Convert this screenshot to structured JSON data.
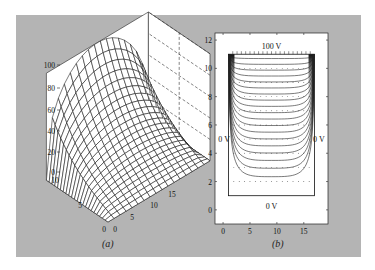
{
  "figure": {
    "background": "#b4b4b4",
    "caption_a": "(a)",
    "caption_b": "(b)"
  },
  "chart_data": [
    {
      "id": "a",
      "type": "surface",
      "title": "",
      "description": "3D mesh surface of potential; 100 at one edge, decaying toward 0",
      "xlabel": "",
      "ylabel": "",
      "zlabel": "",
      "x_ticks": [
        "0",
        "5",
        "10",
        "15"
      ],
      "y_ticks": [
        "0",
        "5",
        "10"
      ],
      "z_ticks": [
        "0",
        "20",
        "40",
        "60",
        "80",
        "100"
      ],
      "xlim": [
        0,
        17
      ],
      "ylim": [
        0,
        11
      ],
      "zlim": [
        0,
        100
      ],
      "grid": false,
      "z_tick_px": [
        172,
        152,
        131,
        110,
        88,
        65
      ]
    },
    {
      "id": "b",
      "type": "contour",
      "title": "",
      "xlabel": "",
      "ylabel": "",
      "x_ticks": [
        "0",
        "5",
        "10",
        "15"
      ],
      "y_ticks": [
        "0",
        "2",
        "4",
        "6",
        "8",
        "10",
        "12"
      ],
      "xlim": [
        -1.5,
        19.5
      ],
      "ylim": [
        -1,
        12.5
      ],
      "boundary_box": {
        "x0": 1,
        "x1": 17,
        "y0": 1,
        "y1": 11
      },
      "annotations": [
        {
          "text": "100 V",
          "x": 9,
          "y": 11.6
        },
        {
          "text": "0 V",
          "x": 0.2,
          "y": 5
        },
        {
          "text": "0 V",
          "x": 17.8,
          "y": 5
        },
        {
          "text": "0 V",
          "x": 9,
          "y": 0.3
        }
      ],
      "contour_levels": [
        5,
        10,
        15,
        20,
        25,
        30,
        35,
        40,
        45,
        50,
        55,
        60,
        65,
        70,
        75,
        80,
        85,
        90,
        95
      ],
      "grid": false
    }
  ]
}
